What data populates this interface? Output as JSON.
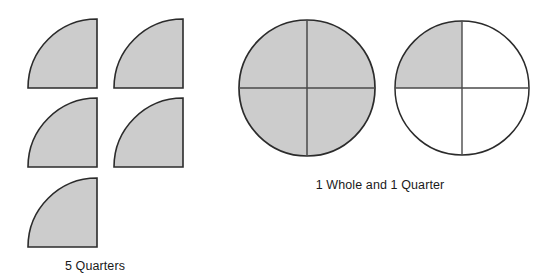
{
  "figure": {
    "background_color": "#ffffff",
    "shade_color": "#cccccc",
    "stroke_color": "#2b2b2b",
    "divider_color": "#4a4a4a",
    "text_color": "#1a1a1a"
  },
  "left_group": {
    "label": "5 Quarters",
    "shape_name": "quarter-circle",
    "count": 5,
    "arc_orientation": "right-angle-at-bottom-right",
    "quarters": [
      {
        "index": 1,
        "x": 28,
        "y": 19,
        "size": 69,
        "filled": true
      },
      {
        "index": 2,
        "x": 114,
        "y": 19,
        "size": 69,
        "filled": true
      },
      {
        "index": 3,
        "x": 28,
        "y": 98,
        "size": 69,
        "filled": true
      },
      {
        "index": 4,
        "x": 114,
        "y": 98,
        "size": 69,
        "filled": true
      },
      {
        "index": 5,
        "x": 28,
        "y": 178,
        "size": 69,
        "filled": true
      }
    ]
  },
  "right_group": {
    "label": "1 Whole and 1 Quarter",
    "circles": [
      {
        "name": "whole-circle",
        "cx": 307,
        "cy": 88,
        "r": 68,
        "quadrants": [
          {
            "name": "top-left",
            "filled": true
          },
          {
            "name": "top-right",
            "filled": true
          },
          {
            "name": "bottom-right",
            "filled": true
          },
          {
            "name": "bottom-left",
            "filled": true
          }
        ],
        "filled_quadrant_count": 4,
        "fraction": "4/4"
      },
      {
        "name": "quarter-circle-in-whole",
        "cx": 462,
        "cy": 88,
        "r": 67,
        "quadrants": [
          {
            "name": "top-left",
            "filled": true
          },
          {
            "name": "top-right",
            "filled": false
          },
          {
            "name": "bottom-right",
            "filled": false
          },
          {
            "name": "bottom-left",
            "filled": false
          }
        ],
        "filled_quadrant_count": 1,
        "fraction": "1/4"
      }
    ]
  }
}
